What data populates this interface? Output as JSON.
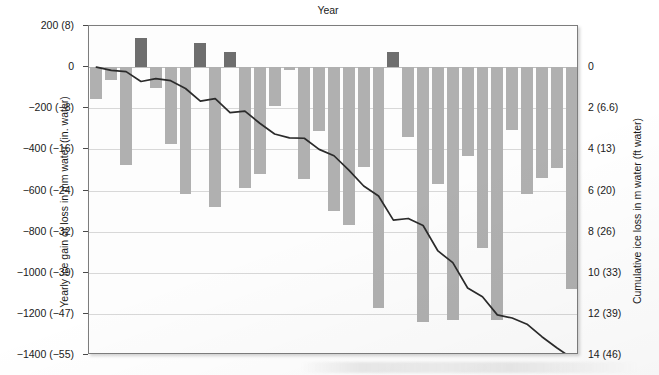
{
  "chart_data": {
    "type": "bar",
    "title": "Year",
    "xlabel": "Year",
    "ylabel": "Yearly ice gain or loss in mm water (in. water)",
    "ylabel_right": "Cumulative ice loss in m water (ft water)",
    "grid": true,
    "legend": "none",
    "ylim": [
      -1400,
      200
    ],
    "ylim_right": [
      0,
      14
    ],
    "xlim": [
      1979.5,
      2012.5
    ],
    "ytick_labels": [
      "200 (8)",
      "0",
      "−200 (−8)",
      "−400 (−16)",
      "−600 (−24)",
      "−800 (−32)",
      "−1000 (−39)",
      "−1200 (−47)",
      "−1400 (−55)"
    ],
    "ytick_values": [
      200,
      0,
      -200,
      -400,
      -600,
      -800,
      -1000,
      -1200,
      -1400
    ],
    "ytick_right_labels": [
      "0",
      "2 (6.6)",
      "4 (13)",
      "6 (20)",
      "8 (26)",
      "10 (33)",
      "12 (39)",
      "14 (46)"
    ],
    "ytick_right_values": [
      0,
      2,
      4,
      6,
      8,
      10,
      12,
      14
    ],
    "xtick_labels": [
      "1980",
      "1985",
      "1990",
      "1995",
      "2000",
      "2005",
      "2010"
    ],
    "xtick_values": [
      1980,
      1985,
      1990,
      1995,
      2000,
      2005,
      2010
    ],
    "categories": [
      1980,
      1981,
      1982,
      1983,
      1984,
      1985,
      1986,
      1987,
      1988,
      1989,
      1990,
      1991,
      1992,
      1993,
      1994,
      1995,
      1996,
      1997,
      1998,
      1999,
      2000,
      2001,
      2002,
      2003,
      2004,
      2005,
      2006,
      2007,
      2008,
      2009,
      2010,
      2011,
      2012
    ],
    "series": [
      {
        "name": "Yearly ice gain or loss (mm water)",
        "type": "bar",
        "color_negative": "#b0b0b0",
        "color_positive": "#6e6e6e",
        "values": [
          -155,
          -65,
          -475,
          140,
          -100,
          -375,
          -615,
          115,
          -680,
          75,
          -590,
          -520,
          -190,
          -15,
          -545,
          -310,
          -700,
          -770,
          -485,
          -1170,
          75,
          -340,
          -1240,
          -570,
          -1230,
          -430,
          -880,
          -1230,
          -305,
          -615,
          -540,
          -490,
          -1080
        ]
      },
      {
        "name": "Cumulative ice loss (m water)",
        "type": "line",
        "color": "#2b2b2b",
        "values": [
          0.0,
          0.16,
          0.22,
          0.7,
          0.56,
          0.66,
          1.04,
          1.65,
          1.53,
          2.21,
          2.14,
          2.73,
          3.25,
          3.44,
          3.46,
          4.0,
          4.31,
          5.01,
          5.78,
          6.27,
          7.44,
          7.36,
          7.7,
          8.94,
          9.51,
          10.74,
          11.17,
          12.05,
          12.2,
          12.5,
          13.11,
          13.65,
          14.14
        ]
      }
    ]
  },
  "axes": {
    "title": "Year",
    "left_axis_title": "Yearly ice gain or loss in mm water (in. water)",
    "right_axis_title": "Cumulative ice loss in m water (ft water)"
  }
}
